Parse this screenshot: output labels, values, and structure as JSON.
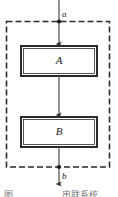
{
  "figure": {
    "type": "block-diagram",
    "background_color": "#ffffff",
    "line_color": "#2b2b2b",
    "box_fill": "#ffffff",
    "boundary": {
      "style": "dashed",
      "dash": "6 3",
      "x": 6,
      "y": 21,
      "width": 104,
      "height": 146
    },
    "blocks": [
      {
        "label": "A",
        "x": 21,
        "y": 46,
        "width": 76,
        "height": 30
      },
      {
        "label": "B",
        "x": 21,
        "y": 117,
        "width": 76,
        "height": 30
      }
    ],
    "signals": [
      {
        "label": "a",
        "position": "top",
        "x": 59,
        "y": 10
      },
      {
        "label": "b",
        "position": "bottom",
        "x": 59,
        "y": 172
      }
    ],
    "nodes": [
      {
        "name": "input-node",
        "x": 59,
        "y": 21
      },
      {
        "name": "output-node",
        "x": 59,
        "y": 167
      }
    ],
    "arrows": [
      {
        "name": "input-arrow",
        "from_y": 0,
        "to_y": 46
      },
      {
        "name": "middle-arrow",
        "from_y": 76,
        "to_y": 117
      },
      {
        "name": "output-arrow",
        "from_y": 147,
        "to_y": 186
      }
    ]
  },
  "caption": {
    "left_fragment": "图",
    "right_fragment": "串联系统",
    "clipped": true
  }
}
